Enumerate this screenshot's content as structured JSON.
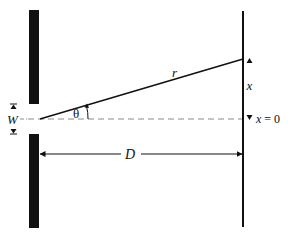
{
  "diagram": {
    "type": "single-slit diffraction geometry",
    "colors": {
      "ink": "#111111",
      "dashed_line": "#8a8a8a",
      "background": "#ffffff"
    },
    "labels": {
      "ray": "r",
      "angle": "θ",
      "slit_width": "W",
      "distance": "D",
      "screen_position": "x",
      "origin": "x = 0"
    },
    "elements": {
      "top_barrier": "slit barrier (upper)",
      "bottom_barrier": "slit barrier (lower)",
      "screen": "observation screen",
      "centerline": "dashed axis",
      "ray_line": "ray r at angle θ"
    }
  }
}
